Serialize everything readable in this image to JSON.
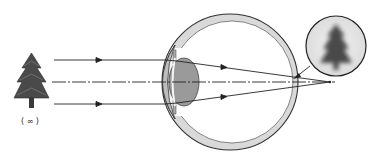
{
  "diagram": {
    "title": "",
    "object_label": "( ∞ )",
    "object": "tree (distant object at infinity)",
    "image": "blurred tree",
    "colors": {
      "line": "#222222",
      "eye_wall": "#d9d9d9",
      "lens": "#9a9a9a",
      "tree": "#4a4a4a",
      "background": "#ffffff"
    },
    "elements": [
      {
        "name": "object-tree",
        "label": "( ∞ )"
      },
      {
        "name": "incident-rays",
        "count": 3
      },
      {
        "name": "optical-axis"
      },
      {
        "name": "eyeball"
      },
      {
        "name": "cornea"
      },
      {
        "name": "lens"
      },
      {
        "name": "retina"
      },
      {
        "name": "focal-point-behind-retina"
      },
      {
        "name": "magnified-blurred-image-inset"
      }
    ]
  }
}
